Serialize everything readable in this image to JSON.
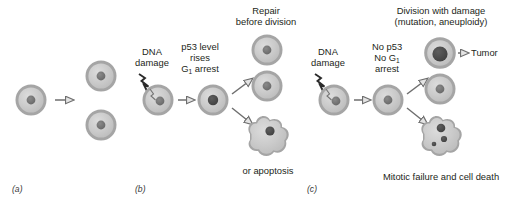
{
  "figure": {
    "title_absent": true,
    "background": "#ffffff",
    "colors": {
      "cell_fill": "#c9c9c9",
      "cell_membrane": "#9a9a9a",
      "nucleus": "#6f6f6f",
      "nucleus_dark": "#4a4a4a",
      "arrow_stroke": "#6e6e6e",
      "arrow_fill": "#e8e8e8",
      "text": "#231f20",
      "bolt": "#2a2a2a"
    }
  },
  "panels": [
    {
      "id": "a",
      "tag": "(a)",
      "description": "Normal cell division",
      "labels": [],
      "cells": [
        {
          "name": "parent-cell",
          "type": "normal"
        },
        {
          "name": "daughter-cell-top",
          "type": "normal"
        },
        {
          "name": "daughter-cell-bottom",
          "type": "normal"
        }
      ]
    },
    {
      "id": "b",
      "tag": "(b)",
      "description": "p53 present: damage triggers arrest, then repair or apoptosis",
      "labels": {
        "damage_line1": "DNA",
        "damage_line2": "damage",
        "state_line1": "p53 level",
        "state_line2": "rises",
        "state_line3_pre": "G",
        "state_line3_sub": "1",
        "state_line3_post": " arrest",
        "outcome_top_line1": "Repair",
        "outcome_top_line2": "before division",
        "outcome_bottom": "or apoptosis"
      },
      "cells": [
        {
          "name": "damaged-cell",
          "type": "damaged"
        },
        {
          "name": "arrested-cell",
          "type": "arrested"
        },
        {
          "name": "repaired-cell-top",
          "type": "normal"
        },
        {
          "name": "repaired-cell-bottom",
          "type": "normal"
        },
        {
          "name": "apoptotic-cell",
          "type": "apoptotic"
        }
      ]
    },
    {
      "id": "c",
      "tag": "(c)",
      "description": "p53 absent: damaged cell divides, yielding tumor or mitotic failure",
      "labels": {
        "damage_line1": "DNA",
        "damage_line2": "damage",
        "state_line1": "No p53",
        "state_line2_pre": "No G",
        "state_line2_sub": "1",
        "state_line3": "arrest",
        "outcome_top_line1": "Division with damage",
        "outcome_top_line2": "(mutation, aneuploidy)",
        "tumor": "Tumor",
        "outcome_bottom": "Mitotic failure and cell death"
      },
      "cells": [
        {
          "name": "damaged-cell",
          "type": "damaged"
        },
        {
          "name": "no-arrest-cell",
          "type": "normal"
        },
        {
          "name": "tumor-cell",
          "type": "tumor"
        },
        {
          "name": "divided-cell",
          "type": "normal"
        },
        {
          "name": "dead-cell",
          "type": "fragmented"
        }
      ]
    }
  ],
  "icons": {
    "lightning_bolt": "dna-damage-bolt-icon",
    "arrow": "open-arrow-icon"
  }
}
